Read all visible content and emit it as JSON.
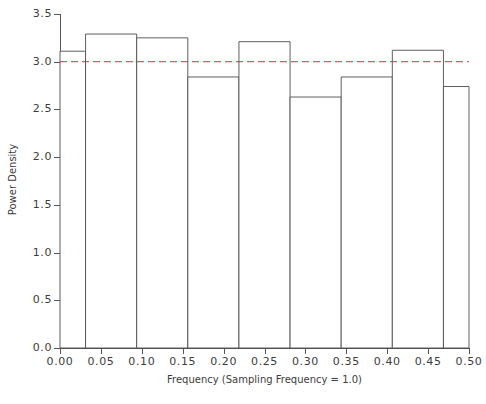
{
  "chart_data": {
    "type": "bar",
    "title": "",
    "subtitle": "",
    "xlabel": "Frequency (Sampling Frequency = 1.0)",
    "ylabel": "Power Density",
    "xlim": [
      0.0,
      0.5
    ],
    "ylim": [
      0.0,
      3.5
    ],
    "grid": false,
    "legend": null,
    "style": "spectral density step histogram, unfilled bars with thin dark outlines",
    "x_ticks": [
      0.0,
      0.05,
      0.1,
      0.15,
      0.2,
      0.25,
      0.3,
      0.35,
      0.4,
      0.45,
      0.5
    ],
    "x_tick_labels": [
      "0.00",
      "0.05",
      "0.10",
      "0.15",
      "0.20",
      "0.25",
      "0.30",
      "0.35",
      "0.40",
      "0.45",
      "0.50"
    ],
    "y_ticks": [
      0.0,
      0.5,
      1.0,
      1.5,
      2.0,
      2.5,
      3.0,
      3.5
    ],
    "y_tick_labels": [
      "0.0",
      "0.5",
      "1.0",
      "1.5",
      "2.0",
      "2.5",
      "3.0",
      "3.5"
    ],
    "bin_edges": [
      0.0,
      0.03125,
      0.09375,
      0.15625,
      0.21875,
      0.28125,
      0.34375,
      0.40625,
      0.46875,
      0.5
    ],
    "values": [
      3.11,
      3.29,
      3.25,
      2.84,
      3.21,
      2.63,
      2.84,
      3.12,
      2.74
    ],
    "bars": [
      {
        "x_start": 0.0,
        "x_end": 0.03125,
        "value": 3.11
      },
      {
        "x_start": 0.03125,
        "x_end": 0.09375,
        "value": 3.29
      },
      {
        "x_start": 0.09375,
        "x_end": 0.15625,
        "value": 3.25
      },
      {
        "x_start": 0.15625,
        "x_end": 0.21875,
        "value": 2.84
      },
      {
        "x_start": 0.21875,
        "x_end": 0.28125,
        "value": 3.21
      },
      {
        "x_start": 0.28125,
        "x_end": 0.34375,
        "value": 2.63
      },
      {
        "x_start": 0.34375,
        "x_end": 0.40625,
        "value": 2.84
      },
      {
        "x_start": 0.40625,
        "x_end": 0.46875,
        "value": 3.12
      },
      {
        "x_start": 0.46875,
        "x_end": 0.5,
        "value": 2.74
      }
    ],
    "reference_line": {
      "name": "theoretical-level",
      "orientation": "horizontal",
      "value": 3.0,
      "style": "dashed",
      "color": "#cc3344"
    },
    "colors": {
      "bar_outline": "#4d4d4d",
      "bar_fill": "#ffffff",
      "axis": "#555555",
      "text": "#3c3c3c",
      "reference_line": "#cc3344",
      "background": "#ffffff"
    }
  }
}
